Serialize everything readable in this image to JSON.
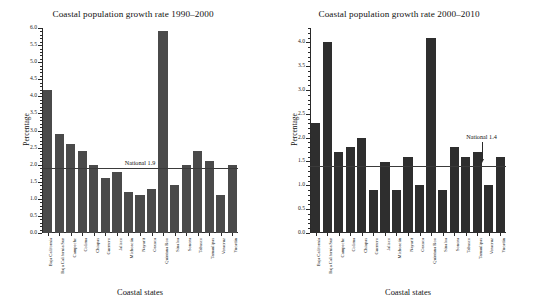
{
  "figure": {
    "background": "#ffffff",
    "bar_color_left": "#4a4a4a",
    "bar_color_right": "#2e2e2e",
    "axis_color": "#2a2a2a"
  },
  "chart_data": [
    {
      "type": "bar",
      "title": "Coastal population growth rate 1990–2000",
      "xlabel": "Coastal states",
      "ylabel": "Percentage",
      "ylim": [
        0.0,
        6.0
      ],
      "ytick_step": 0.5,
      "grid": false,
      "legend": "none",
      "ytick_labels": [
        "0.0",
        "0.5",
        "1.0",
        "1.5",
        "2.0",
        "2.5",
        "3.0",
        "3.5",
        "4.0",
        "4.5",
        "5.0",
        "5.5",
        "6.0"
      ],
      "categories": [
        "Baja California",
        "Baja California Sur",
        "Campeche",
        "Colima",
        "Chiapas",
        "Guerrero",
        "Jalisco",
        "Michoacán",
        "Nayarit",
        "Oaxaca",
        "Quintana Roo",
        "Sinaloa",
        "Sonora",
        "Tabasco",
        "Tamaulipas",
        "Veracruz",
        "Yucatán"
      ],
      "values": [
        4.2,
        2.9,
        2.6,
        2.4,
        2.0,
        1.6,
        1.8,
        1.2,
        1.1,
        1.3,
        5.9,
        1.4,
        2.0,
        2.4,
        2.1,
        1.1,
        2.0
      ],
      "reference_line": {
        "label": "National 1.9",
        "value": 1.9,
        "has_arrow": false
      }
    },
    {
      "type": "bar",
      "title": "Coastal population growth rate 2000–2010",
      "xlabel": "Coastal states",
      "ylabel": "Percentage",
      "ylim": [
        0.0,
        4.3
      ],
      "ytick_step": 0.5,
      "grid": false,
      "legend": "none",
      "ytick_labels": [
        "0.0",
        "0.5",
        "1.0",
        "1.5",
        "2.0",
        "2.5",
        "3.0",
        "3.5",
        "4.0"
      ],
      "categories": [
        "Baja California",
        "Baja California Sur",
        "Campeche",
        "Colima",
        "Chiapas",
        "Guerrero",
        "Jalisco",
        "Michoacán",
        "Nayarit",
        "Oaxaca",
        "Quintana Roo",
        "Sinaloa",
        "Sonora",
        "Tabasco",
        "Tamaulipas",
        "Veracruz",
        "Yucatán"
      ],
      "values": [
        2.3,
        4.0,
        1.7,
        1.8,
        2.0,
        0.9,
        1.5,
        0.9,
        1.6,
        1.0,
        4.1,
        0.9,
        1.8,
        1.6,
        1.7,
        1.0,
        1.6
      ],
      "reference_line": {
        "label": "National 1.4",
        "value": 1.4,
        "has_arrow": true
      }
    }
  ]
}
